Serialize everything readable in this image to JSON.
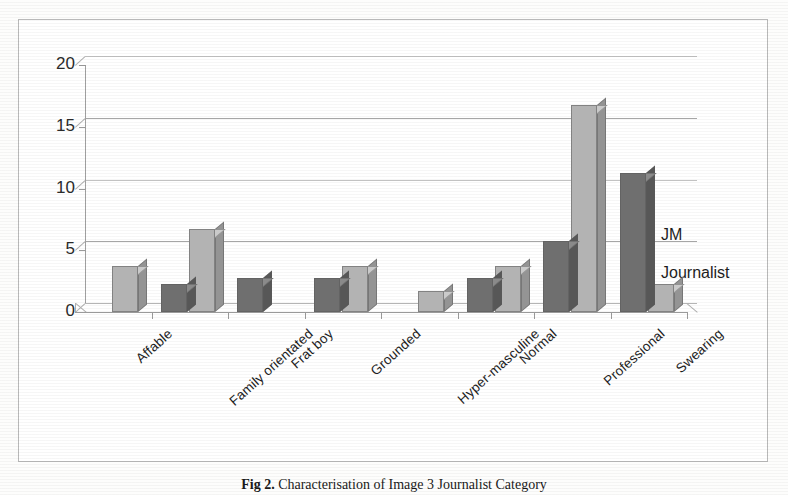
{
  "figure": {
    "caption_number": "Fig 2.",
    "caption_text": "Characterisation of Image 3 Journalist Category"
  },
  "legend": {
    "position": "right",
    "items": [
      {
        "label": "JM",
        "color": "#6f6f6f"
      },
      {
        "label": "Journalist",
        "color": "#b9b9b9"
      }
    ]
  },
  "axes": {
    "y_ticks": [
      "20",
      "15",
      "10",
      "5",
      "0"
    ],
    "x_labels": [
      "Affable",
      "Family orientated",
      "Frat boy",
      "Grounded",
      "Hyper-masculine",
      "Normal",
      "Professional",
      "Swearing"
    ]
  },
  "chart_data": {
    "type": "bar",
    "title": "",
    "subtitle": "",
    "xlabel": "",
    "ylabel": "",
    "ylim": [
      0,
      20
    ],
    "y_ticks": [
      0,
      5,
      10,
      15,
      20
    ],
    "grid": true,
    "legend_position": "right",
    "style": "3d-clustered-column",
    "categories": [
      "Affable",
      "Family orientated",
      "Frat boy",
      "Grounded",
      "Hyper-masculine",
      "Normal",
      "Professional",
      "Swearing"
    ],
    "series": [
      {
        "name": "JM",
        "color": "#6f6f6f",
        "values": [
          0,
          1.5,
          2,
          2,
          0,
          2,
          5,
          10.5
        ]
      },
      {
        "name": "Journalist",
        "color": "#b9b9b9",
        "values": [
          3,
          6,
          0,
          3,
          1,
          3,
          16,
          1.5
        ]
      }
    ]
  }
}
